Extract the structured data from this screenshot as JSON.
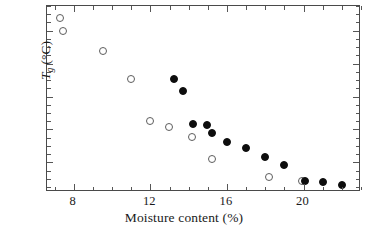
{
  "chart_data": {
    "type": "scatter",
    "title": "",
    "xlabel": "Moisture content (%)",
    "ylabel": "Tg (°C)",
    "ylabel_parts": {
      "symbol": "T",
      "subscript": "g",
      "units": "(°C)"
    },
    "xlim": [
      6.6,
      23.0
    ],
    "ylim": [
      22,
      135
    ],
    "xticks": [
      8,
      12,
      16,
      20
    ],
    "yticks": [
      40,
      60,
      80,
      100,
      120
    ],
    "xticklabels": [
      "8",
      "12",
      "16",
      "20"
    ],
    "yticklabels": [
      "40",
      "60",
      "80",
      "100",
      "120"
    ],
    "x_minor_step": 1,
    "y_minor_step": 5,
    "grid": false,
    "legend": null,
    "frame": "box",
    "tick_direction": "in",
    "series": [
      {
        "name": "open",
        "marker": "open-circle",
        "color": "#ffffff",
        "edge_color": "#5d5d5d",
        "points": [
          {
            "x": 7.3,
            "y": 128
          },
          {
            "x": 7.45,
            "y": 120
          },
          {
            "x": 9.5,
            "y": 107.5
          },
          {
            "x": 11.0,
            "y": 90.5
          },
          {
            "x": 12.0,
            "y": 65
          },
          {
            "x": 12.95,
            "y": 61.5
          },
          {
            "x": 14.15,
            "y": 55.5
          },
          {
            "x": 15.2,
            "y": 42
          },
          {
            "x": 18.2,
            "y": 31
          },
          {
            "x": 19.9,
            "y": 28.5
          }
        ]
      },
      {
        "name": "filled",
        "marker": "filled-circle",
        "color": "#0d0d0d",
        "edge_color": "#0d0d0d",
        "points": [
          {
            "x": 13.25,
            "y": 90.5
          },
          {
            "x": 13.7,
            "y": 83.5
          },
          {
            "x": 14.2,
            "y": 63.5
          },
          {
            "x": 14.95,
            "y": 62.5
          },
          {
            "x": 15.2,
            "y": 58
          },
          {
            "x": 16.0,
            "y": 52.5
          },
          {
            "x": 17.0,
            "y": 48.5
          },
          {
            "x": 18.0,
            "y": 43.5
          },
          {
            "x": 19.0,
            "y": 38.5
          },
          {
            "x": 20.05,
            "y": 28.5
          },
          {
            "x": 21.0,
            "y": 28
          },
          {
            "x": 22.0,
            "y": 26
          }
        ]
      }
    ]
  }
}
